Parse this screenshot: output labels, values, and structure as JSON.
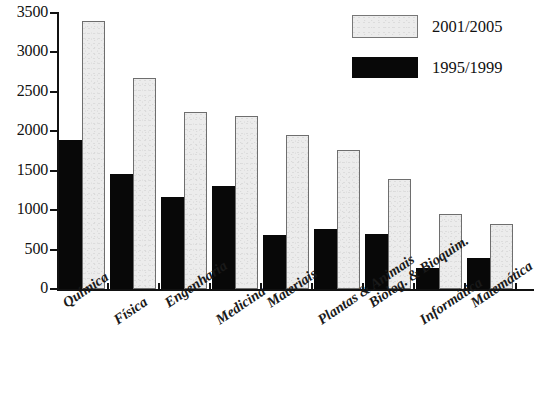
{
  "chart_data": {
    "type": "bar",
    "title": "",
    "xlabel": "",
    "ylabel": "",
    "ylim": [
      0,
      3500
    ],
    "ytick_step": 500,
    "yticks": [
      0,
      500,
      1000,
      1500,
      2000,
      2500,
      3000,
      3500
    ],
    "ytick_labels": [
      "0",
      "500",
      "1000",
      "1500",
      "2000",
      "2500",
      "3000",
      "3500"
    ],
    "grid": false,
    "legend_position": "top-right",
    "categories": [
      "Química",
      "Física",
      "Engenharia",
      "Medicina",
      "Materiais",
      "Plantas & Animais",
      "Biolog. & Bioquim.",
      "Informática",
      "Matemática"
    ],
    "series": [
      {
        "name": "1995/1999",
        "color": "#080808",
        "values": [
          1890,
          1460,
          1165,
          1310,
          680,
          755,
          700,
          265,
          390
        ]
      },
      {
        "name": "2001/2005",
        "color": "#ececec",
        "values": [
          3400,
          2680,
          2250,
          2195,
          1955,
          1760,
          1400,
          945,
          820
        ]
      }
    ]
  },
  "legend": {
    "entries": [
      {
        "label": "2001/2005",
        "swatch": "light-gray-filled-rect"
      },
      {
        "label": "1995/1999",
        "swatch": "black-filled-rect"
      }
    ]
  },
  "axis": {
    "y_tick_labels": [
      "3500",
      "3000",
      "2500",
      "2000",
      "1500",
      "1000",
      "500",
      "0"
    ]
  }
}
